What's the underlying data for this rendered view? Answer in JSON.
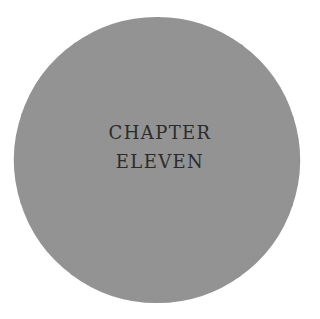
{
  "page": {
    "background_color": "#ffffff",
    "width": 320,
    "height": 319
  },
  "heading": {
    "line1": "Chapter",
    "line2": "Eleven",
    "text_color": "#2b2b2b",
    "style": "small-caps"
  },
  "graphic": {
    "name": "pinwheel-disc",
    "blade_count": 10,
    "blade_color": "#c2c2c2",
    "gap_color": "#ffffff",
    "center_x": 157,
    "center_y": 160,
    "outer_radius": 143,
    "inner_radius": 30,
    "rotation_direction": "counterclockwise"
  }
}
